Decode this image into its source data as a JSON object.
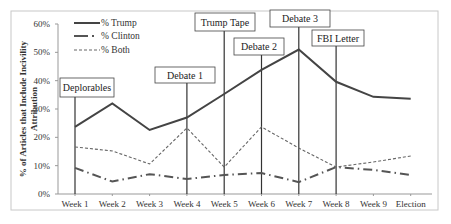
{
  "chart_data": {
    "type": "line",
    "title": "",
    "xlabel": "",
    "ylabel": "% of Articles that Include Incivility Attribution",
    "ylabel_lines": [
      "% of Articles that Include Incivility",
      "Attribution"
    ],
    "ylim": [
      0,
      60
    ],
    "yticks": [
      "0%",
      "10%",
      "20%",
      "30%",
      "40%",
      "50%",
      "60%"
    ],
    "categories": [
      "Week 1",
      "Week 2",
      "Week 3",
      "Week 4",
      "Week 5",
      "Week 6",
      "Week 7",
      "Week 8",
      "Week 9",
      "Election"
    ],
    "grid": false,
    "legend_position": "top-left",
    "series": [
      {
        "name": "% Trump",
        "style": "solid",
        "color": "#444444",
        "values": [
          23.7,
          32.0,
          22.6,
          27.0,
          35.3,
          43.8,
          51.0,
          39.6,
          34.3,
          33.6
        ]
      },
      {
        "name": "% Clinton",
        "style": "dash-dot",
        "color": "#555555",
        "values": [
          9.2,
          4.4,
          7.0,
          5.3,
          6.7,
          7.4,
          4.2,
          9.5,
          8.5,
          6.7
        ]
      },
      {
        "name": "% Both",
        "style": "dashed",
        "color": "#666666",
        "values": [
          16.6,
          15.2,
          10.6,
          23.3,
          9.5,
          23.7,
          16.2,
          9.5,
          11.3,
          13.4
        ]
      }
    ],
    "annotations": [
      {
        "label": "Deplorables",
        "week_index": 0
      },
      {
        "label": "Debate 1",
        "week_index": 3
      },
      {
        "label": "Trump Tape",
        "week_index": 4
      },
      {
        "label": "Debate 2",
        "week_index": 5
      },
      {
        "label": "Debate 3",
        "week_index": 6
      },
      {
        "label": "FBI Letter",
        "week_index": 7
      }
    ]
  }
}
